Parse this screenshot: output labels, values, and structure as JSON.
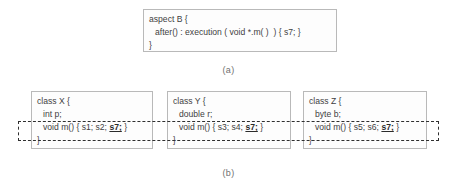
{
  "figure": {
    "part_a": {
      "caption": "(a)",
      "box": {
        "lines": [
          "aspect B {",
          "after() : execution ( void *.m( )  ) { s7; }",
          "}"
        ],
        "line_1": "aspect B {",
        "line_2": "after() : execution ( void *.m( )  ) { s7; }",
        "line_3": "}"
      }
    },
    "part_b": {
      "caption": "(b)",
      "classes": [
        {
          "header": "class X {",
          "field": "int p;",
          "method_prefix": "void m() { s1; s2; ",
          "method_statement": "s7;",
          "method_suffix": " }",
          "closing": "}"
        },
        {
          "header": "class Y {",
          "field": "double r;",
          "method_prefix": "void m() { s3; s4; ",
          "method_statement": "s7;",
          "method_suffix": " }",
          "closing": "}"
        },
        {
          "header": "class Z {",
          "field": "byte b;",
          "method_prefix": "void m() { s5; s6; ",
          "method_statement": "s7;",
          "method_suffix": " }",
          "closing": "}"
        }
      ]
    }
  },
  "colors": {
    "box_border": "#b9b9b9",
    "crosscut_border": "#2f2f2f",
    "text": "#3f3f3f",
    "caption": "#707070",
    "background": "#ffffff"
  }
}
